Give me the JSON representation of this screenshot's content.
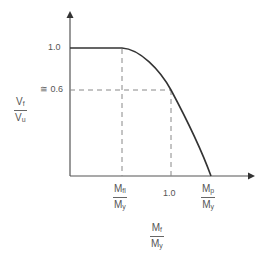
{
  "diagram": {
    "y_axis_label": {
      "num": "V",
      "num_sub": "f",
      "den": "V",
      "den_sub": "u"
    },
    "x_axis_label": {
      "num": "M",
      "num_sub": "f",
      "den": "M",
      "den_sub": "y"
    },
    "y_ticks": {
      "top": "1.0",
      "mid": "≅ 0.6"
    },
    "x_ticks": {
      "first": {
        "num": "M",
        "num_sub": "fl",
        "den": "M",
        "den_sub": "y"
      },
      "mid": "1.0",
      "last": {
        "num": "M",
        "num_sub": "p",
        "den": "M",
        "den_sub": "y"
      }
    },
    "colors": {
      "curve": "#333333",
      "axis": "#555555",
      "dash": "#888888"
    }
  }
}
